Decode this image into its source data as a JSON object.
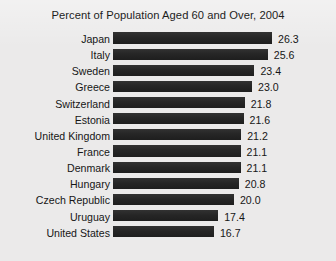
{
  "chart_data": {
    "type": "bar",
    "orientation": "horizontal",
    "title": "Percent of Population Aged 60 and Over, 2004",
    "xlabel": "",
    "ylabel": "",
    "xlim": [
      0,
      26.3
    ],
    "grid": false,
    "legend": false,
    "value_label_format": "one-decimal",
    "categories": [
      "Japan",
      "Italy",
      "Sweden",
      "Greece",
      "Switzerland",
      "Estonia",
      "United Kingdom",
      "France",
      "Denmark",
      "Hungary",
      "Czech Republic",
      "Uruguay",
      "United States"
    ],
    "values": [
      26.3,
      25.6,
      23.4,
      23.0,
      21.8,
      21.6,
      21.2,
      21.1,
      21.1,
      20.8,
      20.0,
      17.4,
      16.7
    ],
    "value_labels": [
      "26.3",
      "25.6",
      "23.4",
      "23.0",
      "21.8",
      "21.6",
      "21.2",
      "21.1",
      "21.1",
      "20.8",
      "20.0",
      "17.4",
      "16.7"
    ]
  },
  "style": {
    "background_color": "#ebeaea",
    "bar_color": "#262626",
    "text_color": "#161616"
  }
}
